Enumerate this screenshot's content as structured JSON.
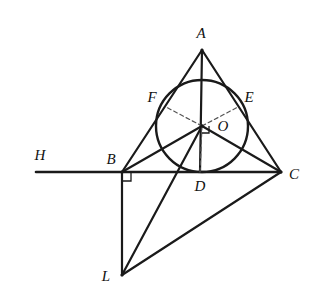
{
  "figure": {
    "canvas": {
      "width": 320,
      "height": 308
    },
    "style": {
      "background_color": "#ffffff",
      "stroke_color": "#1a1a1a",
      "dashed_stroke_color": "#555555",
      "label_color": "#111111",
      "solid_stroke_width": 2.2,
      "thick_stroke_width": 2.6,
      "circle_stroke_width": 2.4,
      "dash_pattern": "4,3"
    },
    "points": {
      "A": {
        "label": "A",
        "x": 202,
        "y": 50,
        "label_x": 201,
        "label_y": 33
      },
      "B": {
        "label": "B",
        "x": 122,
        "y": 172,
        "label_x": 111,
        "label_y": 159
      },
      "C": {
        "label": "C",
        "x": 281,
        "y": 172,
        "label_x": 294,
        "label_y": 174
      },
      "D": {
        "label": "D",
        "x": 200,
        "y": 172,
        "label_x": 200,
        "label_y": 186
      },
      "E": {
        "label": "E",
        "x": 238,
        "y": 107,
        "label_x": 249,
        "label_y": 97
      },
      "F": {
        "label": "F",
        "x": 166,
        "y": 107,
        "label_x": 152,
        "label_y": 97
      },
      "O": {
        "label": "O",
        "x": 202,
        "y": 126,
        "label_x": 223,
        "label_y": 126
      },
      "H": {
        "label": "H",
        "x": 36,
        "y": 172,
        "label_x": 40,
        "label_y": 155
      },
      "L": {
        "label": "L",
        "x": 122,
        "y": 275,
        "label_x": 106,
        "label_y": 276
      }
    },
    "incircle": {
      "cx": 202,
      "cy": 126,
      "r": 46
    },
    "solid_segments": [
      {
        "name": "segment-ray-HB",
        "from": "H",
        "to": "B"
      },
      {
        "name": "segment-BC",
        "from": "B",
        "to": "C"
      },
      {
        "name": "segment-AB",
        "from": "A",
        "to": "B"
      },
      {
        "name": "segment-AC",
        "from": "A",
        "to": "C"
      },
      {
        "name": "segment-AD",
        "from": "A",
        "to": "D"
      },
      {
        "name": "segment-BO",
        "from": "B",
        "to": "O"
      },
      {
        "name": "segment-OC",
        "from": "O",
        "to": "C"
      },
      {
        "name": "segment-OL",
        "from": "O",
        "to": "L"
      },
      {
        "name": "segment-BL",
        "from": "B",
        "to": "L"
      },
      {
        "name": "segment-LC",
        "from": "L",
        "to": "C"
      }
    ],
    "dashed_segments": [
      {
        "name": "segment-OF",
        "from": "O",
        "to": "F"
      },
      {
        "name": "segment-OE",
        "from": "O",
        "to": "E"
      },
      {
        "name": "segment-OD",
        "from": "O",
        "to": "D"
      }
    ],
    "right_angle_marks": [
      {
        "name": "right-angle-at-B",
        "x": 122,
        "y": 172,
        "dx": 1,
        "dy": 1,
        "size": 9
      },
      {
        "name": "right-angle-at-O",
        "x": 202,
        "y": 126,
        "dx": 1,
        "dy": 1,
        "size": 7
      }
    ],
    "labels": [
      "A",
      "F",
      "E",
      "O",
      "H",
      "B",
      "D",
      "C",
      "L"
    ]
  }
}
